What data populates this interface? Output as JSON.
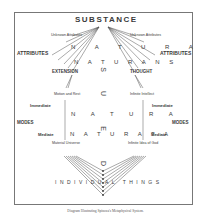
{
  "diagram": {
    "title": "SUBSTANCE",
    "caption": "Diagram Illustrating Spinoza's Metaphysical System.",
    "left_labels": {
      "unknown_attributes": "Unknown Attributes",
      "attributes": "ATTRIBUTES",
      "extension": "EXTENSION",
      "motion_rest": "Motion and Rest",
      "immediate": "Immediate",
      "modes": "MODES",
      "mediate": "Mediate",
      "material_universe": "Material Universe"
    },
    "right_labels": {
      "unknown_attributes": "Unknown Attributes",
      "attributes": "ATTRIBUTES",
      "thought": "THOUGHT",
      "infinite_intellect": "Infinite Intellect",
      "immediate": "Immediate",
      "modes": "MODES",
      "mediate": "Mediate",
      "infinite_idea": "Infinite Idea of God"
    },
    "center": {
      "natura_1": "N A T U R A",
      "naturans": "N A T U R A N S",
      "natura_2": "N A T U R A",
      "naturata": "N A T U R A T A",
      "individual_things": "INDIVIDUAL THINGS",
      "vertical_letters": [
        "S",
        "U",
        "E",
        "D"
      ],
      "vertical_word": "DEUS"
    }
  }
}
